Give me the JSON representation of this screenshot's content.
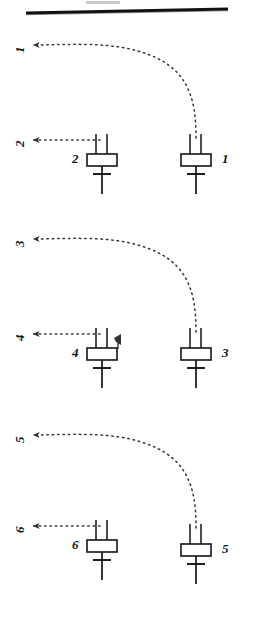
{
  "figure": {
    "background_color": "#ffffff",
    "ink_color": "#151515",
    "header_rule": {
      "name": "top-horizontal-rule",
      "visible": true,
      "smudge_above": true
    },
    "groups": [
      {
        "id": "group-1",
        "right_symbol": {
          "name": "device-symbol-1",
          "label": "1",
          "label_side": "right"
        },
        "left_symbol": {
          "name": "device-symbol-2",
          "label": "2",
          "label_side": "left"
        },
        "curved_arrow": {
          "name": "curved-dotted-arrow-1",
          "label": "1",
          "label_rotated": true,
          "direction": "up-left"
        },
        "straight_arrow": {
          "name": "straight-dotted-arrow-2",
          "label": "2",
          "label_rotated": true,
          "direction": "left"
        },
        "extra_arrowhead": false
      },
      {
        "id": "group-2",
        "right_symbol": {
          "name": "device-symbol-3",
          "label": "3",
          "label_side": "right"
        },
        "left_symbol": {
          "name": "device-symbol-4",
          "label": "4",
          "label_side": "left"
        },
        "curved_arrow": {
          "name": "curved-dotted-arrow-3",
          "label": "3",
          "label_rotated": true,
          "direction": "up-left"
        },
        "straight_arrow": {
          "name": "straight-dotted-arrow-4",
          "label": "4",
          "label_rotated": true,
          "direction": "left"
        },
        "extra_arrowhead": true
      },
      {
        "id": "group-3",
        "right_symbol": {
          "name": "device-symbol-5",
          "label": "5",
          "label_side": "right"
        },
        "left_symbol": {
          "name": "device-symbol-6",
          "label": "6",
          "label_side": "left"
        },
        "curved_arrow": {
          "name": "curved-dotted-arrow-5",
          "label": "5",
          "label_rotated": true,
          "direction": "up-left"
        },
        "straight_arrow": {
          "name": "straight-dotted-arrow-6",
          "label": "6",
          "label_rotated": true,
          "direction": "left"
        },
        "extra_arrowhead": false
      }
    ]
  }
}
